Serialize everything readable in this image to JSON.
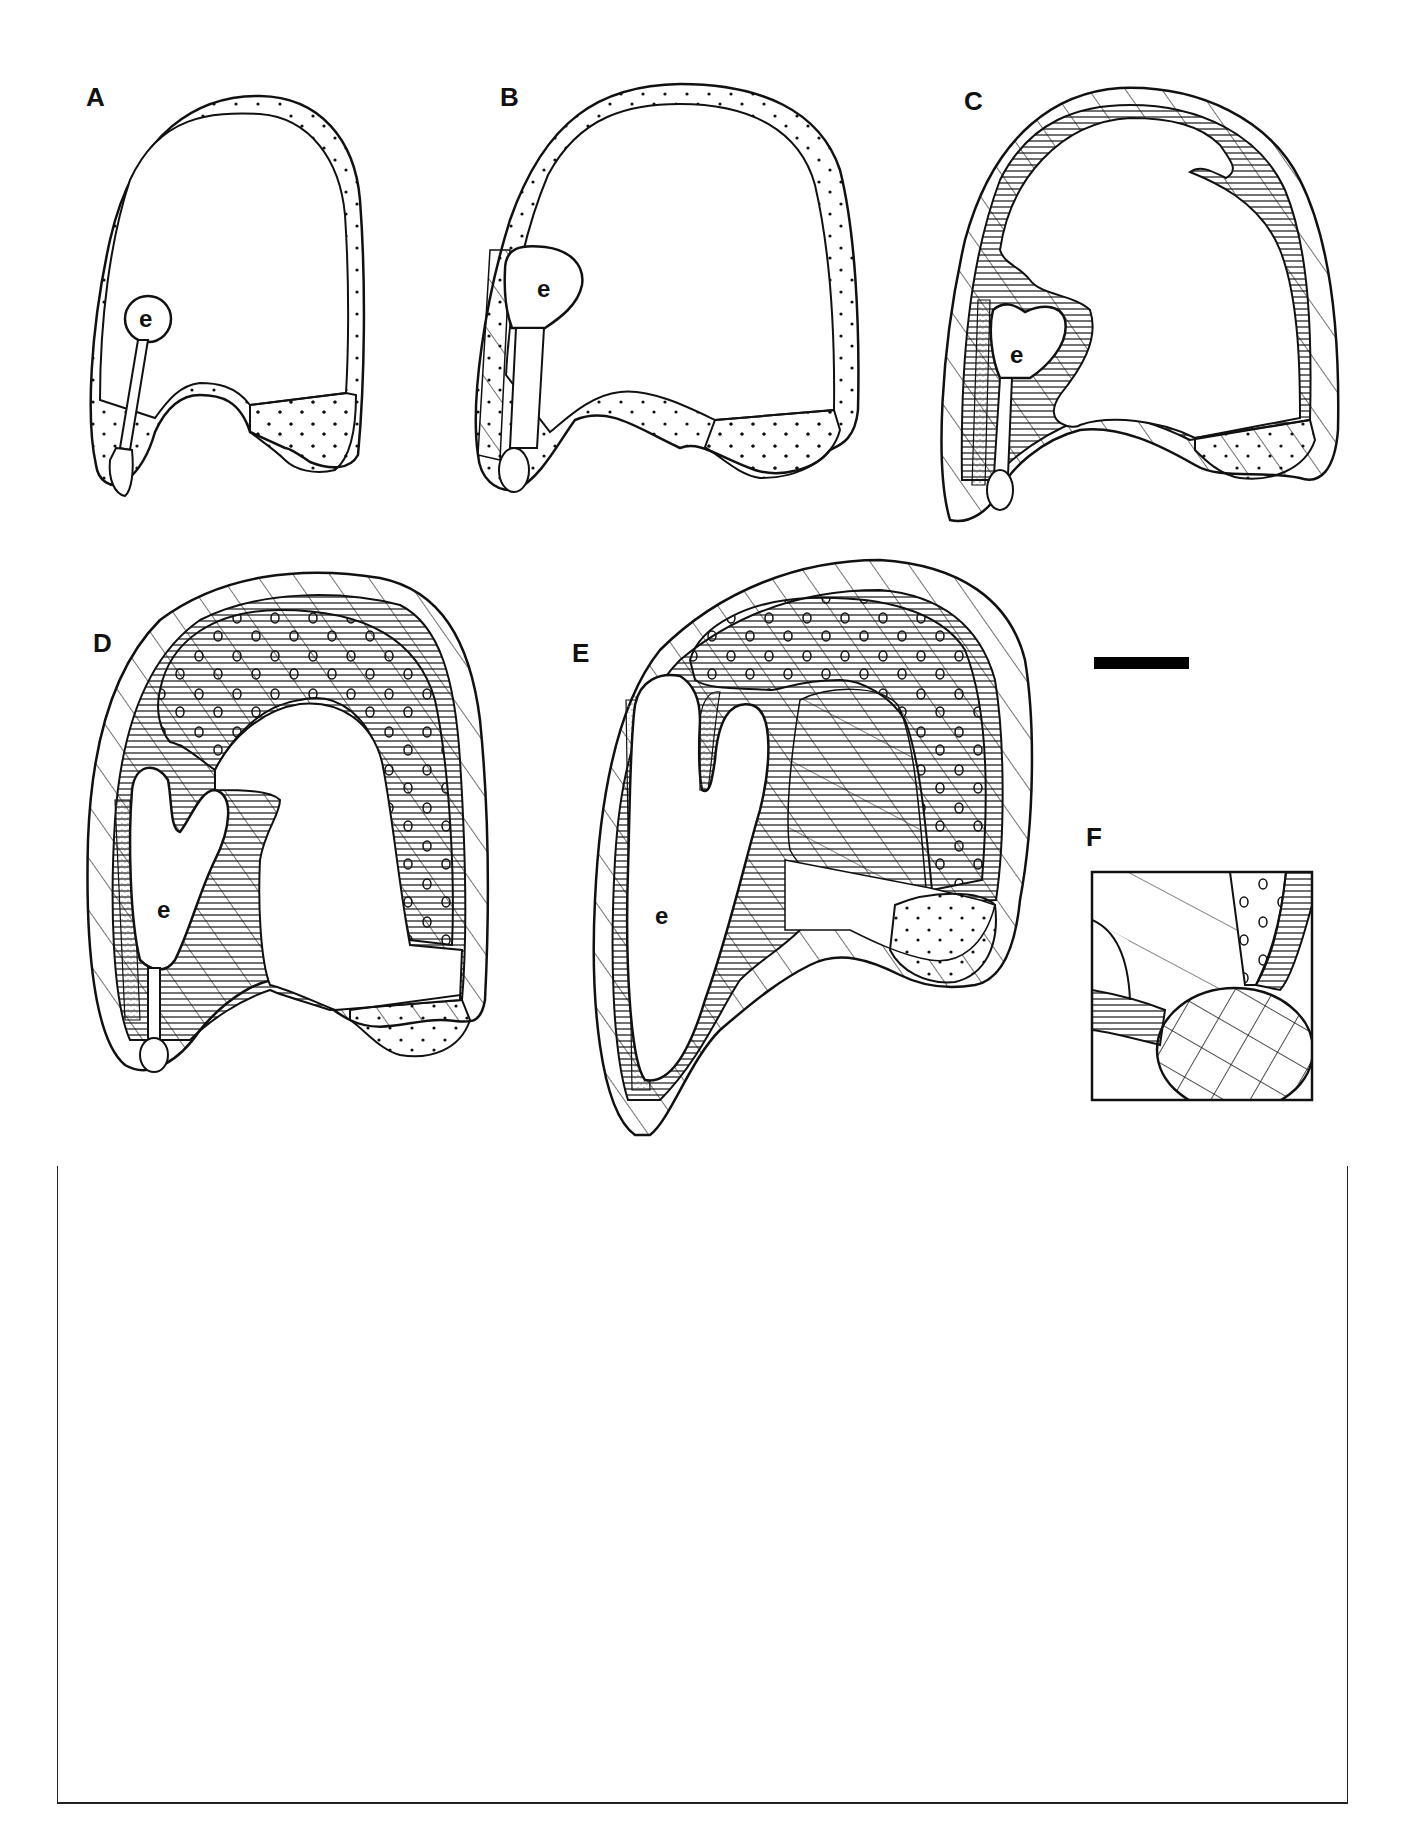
{
  "figure": {
    "panels": [
      {
        "id": "A",
        "label": "A",
        "embryo_label": "e"
      },
      {
        "id": "B",
        "label": "B",
        "embryo_label": "e"
      },
      {
        "id": "C",
        "label": "C",
        "embryo_label": "e"
      },
      {
        "id": "D",
        "label": "D",
        "embryo_label": "e"
      },
      {
        "id": "E",
        "label": "E",
        "embryo_label": "e"
      },
      {
        "id": "F",
        "label": "F"
      }
    ],
    "scale_bar": {
      "color": "#000000"
    }
  },
  "colors": {
    "ink": "#111111",
    "background": "#ffffff",
    "stipple": "#888888"
  }
}
